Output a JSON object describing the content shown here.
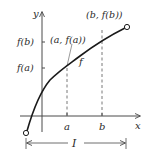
{
  "diagram": {
    "axes": {
      "x_label": "x",
      "y_label": "y"
    },
    "ticks": {
      "x": [
        {
          "label": "a",
          "pos": 67
        },
        {
          "label": "b",
          "pos": 102
        }
      ],
      "y": [
        {
          "label": "f(b)",
          "pos": 42
        },
        {
          "label": "f(a)",
          "pos": 68
        }
      ]
    },
    "points": [
      {
        "label": "(a, f(a))"
      },
      {
        "label": "(b, f(b))"
      }
    ],
    "curve_label": "f",
    "interval_label": "I",
    "colors": {
      "curve": "#1a1a1a",
      "axis": "#4a4a4a",
      "dashed": "#555555",
      "text": "#2a2a2a"
    }
  }
}
